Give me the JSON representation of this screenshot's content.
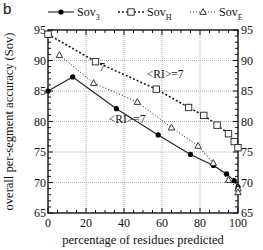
{
  "panel_label": "b",
  "chart_data": {
    "type": "line",
    "title": "",
    "xlabel": "percentage of residues predicted",
    "ylabel": "overall per-segment accuracy (Sov)",
    "xlim": [
      0,
      100
    ],
    "ylim": [
      65,
      95
    ],
    "xticks": [
      0,
      20,
      40,
      60,
      80,
      100
    ],
    "yticks": [
      65,
      70,
      75,
      80,
      85,
      90,
      95
    ],
    "grid": true,
    "legend_position": "top",
    "series": [
      {
        "name": "Sov3",
        "label_main": "Sov",
        "label_sub": "3",
        "marker": "filled-circle",
        "line": "solid",
        "x": [
          0,
          13,
          36,
          58,
          75,
          87,
          94,
          98,
          100
        ],
        "y": [
          85.0,
          87.3,
          82.1,
          77.8,
          74.6,
          72.8,
          71.4,
          70.3,
          69.3
        ]
      },
      {
        "name": "SovH",
        "label_main": "Sov",
        "label_sub": "H",
        "marker": "open-square",
        "line": "dashed",
        "x": [
          0,
          25,
          57,
          74,
          82,
          89,
          95,
          98,
          100
        ],
        "y": [
          94.3,
          89.8,
          85.3,
          82.3,
          81.0,
          79.4,
          78.0,
          76.7,
          75.7
        ]
      },
      {
        "name": "SovE",
        "label_main": "Sov",
        "label_sub": "E",
        "marker": "open-triangle",
        "line": "dotted",
        "x": [
          6,
          24,
          47,
          65,
          79,
          87,
          95,
          100,
          100
        ],
        "y": [
          90.9,
          86.3,
          83.2,
          79.0,
          76.0,
          73.2,
          70.4,
          69.0,
          68.4
        ]
      }
    ],
    "annotations": [
      {
        "text": "7",
        "x": 27,
        "y": 88.3
      },
      {
        "text": "<RI>=7",
        "x": 52,
        "y": 87.2
      },
      {
        "text": "<RI>=7",
        "x": 32,
        "y": 79.8
      }
    ]
  }
}
